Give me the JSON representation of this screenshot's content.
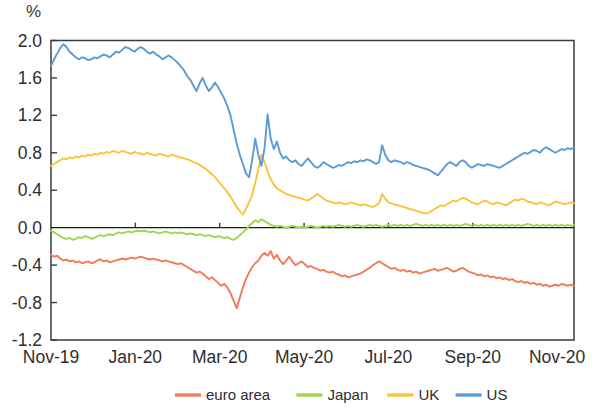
{
  "chart_data": {
    "type": "line",
    "title": "",
    "subtitle": "",
    "unit_label": "%",
    "xlabel": "",
    "ylabel": "",
    "ylim": [
      -1.2,
      2.0
    ],
    "ytick_values": [
      2.0,
      1.6,
      1.2,
      0.8,
      0.4,
      0.0,
      -0.4,
      -0.8,
      -1.2
    ],
    "ytick_labels": [
      "2.0",
      "1.6",
      "1.2",
      "0.8",
      "0.4",
      "0.0",
      "-0.4",
      "-0.8",
      "-1.2"
    ],
    "xtick_labels": [
      "Nov-19",
      "Jan-20",
      "Mar-20",
      "May-20",
      "Jul-20",
      "Sep-20",
      "Nov-20"
    ],
    "xtick_positions": [
      0,
      2,
      4,
      6,
      8,
      10,
      12
    ],
    "xlim": [
      0,
      12.4
    ],
    "grid": false,
    "legend_position": "bottom",
    "colors": {
      "euro area": "#f07a5a",
      "Japan": "#a3d44e",
      "UK": "#f5c53d",
      "US": "#5b9bd5",
      "axis": "#3b3b3b",
      "zero_line": "#1a1a1a",
      "background": "#ffffff"
    },
    "series": [
      {
        "name": "euro area",
        "color": "#f07a5a",
        "values": [
          -0.29,
          -0.31,
          -0.3,
          -0.33,
          -0.35,
          -0.34,
          -0.36,
          -0.35,
          -0.37,
          -0.36,
          -0.38,
          -0.37,
          -0.36,
          -0.38,
          -0.37,
          -0.35,
          -0.34,
          -0.36,
          -0.35,
          -0.37,
          -0.36,
          -0.35,
          -0.34,
          -0.33,
          -0.34,
          -0.33,
          -0.32,
          -0.33,
          -0.32,
          -0.31,
          -0.32,
          -0.33,
          -0.34,
          -0.33,
          -0.34,
          -0.35,
          -0.36,
          -0.35,
          -0.36,
          -0.37,
          -0.38,
          -0.39,
          -0.38,
          -0.4,
          -0.42,
          -0.44,
          -0.46,
          -0.48,
          -0.47,
          -0.49,
          -0.52,
          -0.55,
          -0.53,
          -0.56,
          -0.59,
          -0.62,
          -0.6,
          -0.64,
          -0.7,
          -0.78,
          -0.86,
          -0.75,
          -0.64,
          -0.55,
          -0.48,
          -0.42,
          -0.38,
          -0.35,
          -0.3,
          -0.27,
          -0.3,
          -0.25,
          -0.33,
          -0.29,
          -0.35,
          -0.39,
          -0.35,
          -0.31,
          -0.36,
          -0.4,
          -0.38,
          -0.36,
          -0.39,
          -0.42,
          -0.41,
          -0.43,
          -0.44,
          -0.46,
          -0.45,
          -0.47,
          -0.48,
          -0.47,
          -0.49,
          -0.5,
          -0.52,
          -0.51,
          -0.53,
          -0.52,
          -0.51,
          -0.5,
          -0.49,
          -0.47,
          -0.45,
          -0.43,
          -0.4,
          -0.38,
          -0.36,
          -0.38,
          -0.4,
          -0.42,
          -0.44,
          -0.43,
          -0.45,
          -0.46,
          -0.45,
          -0.47,
          -0.46,
          -0.48,
          -0.47,
          -0.49,
          -0.48,
          -0.47,
          -0.46,
          -0.45,
          -0.44,
          -0.46,
          -0.45,
          -0.44,
          -0.43,
          -0.45,
          -0.47,
          -0.46,
          -0.44,
          -0.43,
          -0.45,
          -0.47,
          -0.48,
          -0.49,
          -0.51,
          -0.5,
          -0.52,
          -0.51,
          -0.53,
          -0.52,
          -0.54,
          -0.53,
          -0.55,
          -0.54,
          -0.56,
          -0.55,
          -0.57,
          -0.58,
          -0.57,
          -0.59,
          -0.58,
          -0.6,
          -0.59,
          -0.61,
          -0.6,
          -0.62,
          -0.61,
          -0.63,
          -0.62,
          -0.61,
          -0.62,
          -0.6,
          -0.61,
          -0.62,
          -0.61,
          -0.62
        ]
      },
      {
        "name": "Japan",
        "color": "#a3d44e",
        "values": [
          -0.03,
          -0.05,
          -0.07,
          -0.09,
          -0.11,
          -0.12,
          -0.11,
          -0.13,
          -0.12,
          -0.1,
          -0.11,
          -0.09,
          -0.1,
          -0.12,
          -0.11,
          -0.09,
          -0.08,
          -0.09,
          -0.08,
          -0.07,
          -0.08,
          -0.06,
          -0.05,
          -0.06,
          -0.05,
          -0.04,
          -0.05,
          -0.04,
          -0.03,
          -0.04,
          -0.03,
          -0.04,
          -0.05,
          -0.04,
          -0.05,
          -0.06,
          -0.05,
          -0.04,
          -0.05,
          -0.06,
          -0.05,
          -0.06,
          -0.05,
          -0.06,
          -0.07,
          -0.06,
          -0.07,
          -0.08,
          -0.07,
          -0.08,
          -0.09,
          -0.08,
          -0.09,
          -0.1,
          -0.09,
          -0.1,
          -0.11,
          -0.1,
          -0.12,
          -0.13,
          -0.11,
          -0.08,
          -0.05,
          -0.02,
          0.02,
          0.05,
          0.08,
          0.06,
          0.09,
          0.07,
          0.05,
          0.03,
          0.02,
          0.01,
          0.02,
          0.01,
          0.0,
          0.01,
          0.02,
          0.01,
          0.0,
          0.01,
          0.0,
          0.01,
          0.02,
          0.01,
          0.0,
          0.01,
          0.02,
          0.01,
          0.02,
          0.01,
          0.02,
          0.03,
          0.02,
          0.01,
          0.02,
          0.01,
          0.02,
          0.03,
          0.02,
          0.01,
          0.02,
          0.03,
          0.02,
          0.03,
          0.02,
          0.01,
          0.02,
          0.03,
          0.02,
          0.03,
          0.02,
          0.03,
          0.02,
          0.03,
          0.02,
          0.03,
          0.04,
          0.03,
          0.02,
          0.03,
          0.02,
          0.03,
          0.02,
          0.03,
          0.02,
          0.03,
          0.02,
          0.03,
          0.02,
          0.03,
          0.02,
          0.03,
          0.04,
          0.03,
          0.02,
          0.03,
          0.02,
          0.03,
          0.02,
          0.03,
          0.02,
          0.03,
          0.02,
          0.03,
          0.02,
          0.03,
          0.02,
          0.03,
          0.02,
          0.03,
          0.02,
          0.03,
          0.04,
          0.03,
          0.02,
          0.03,
          0.02,
          0.03,
          0.02,
          0.03,
          0.02,
          0.03,
          0.02,
          0.03,
          0.02,
          0.03,
          0.02,
          0.03
        ]
      },
      {
        "name": "UK",
        "color": "#f5c53d",
        "values": [
          0.66,
          0.68,
          0.7,
          0.72,
          0.74,
          0.73,
          0.75,
          0.74,
          0.76,
          0.75,
          0.77,
          0.76,
          0.78,
          0.77,
          0.79,
          0.78,
          0.8,
          0.79,
          0.81,
          0.8,
          0.82,
          0.81,
          0.8,
          0.82,
          0.81,
          0.8,
          0.79,
          0.81,
          0.8,
          0.79,
          0.78,
          0.8,
          0.79,
          0.78,
          0.77,
          0.79,
          0.78,
          0.77,
          0.76,
          0.78,
          0.77,
          0.76,
          0.75,
          0.74,
          0.73,
          0.72,
          0.7,
          0.69,
          0.67,
          0.65,
          0.63,
          0.6,
          0.57,
          0.54,
          0.5,
          0.46,
          0.42,
          0.38,
          0.33,
          0.28,
          0.22,
          0.18,
          0.14,
          0.2,
          0.27,
          0.35,
          0.48,
          0.62,
          0.78,
          0.7,
          0.6,
          0.52,
          0.46,
          0.42,
          0.4,
          0.38,
          0.36,
          0.35,
          0.34,
          0.33,
          0.32,
          0.31,
          0.3,
          0.29,
          0.31,
          0.33,
          0.36,
          0.34,
          0.31,
          0.29,
          0.28,
          0.27,
          0.26,
          0.27,
          0.26,
          0.25,
          0.26,
          0.27,
          0.26,
          0.25,
          0.24,
          0.25,
          0.24,
          0.23,
          0.22,
          0.24,
          0.26,
          0.36,
          0.31,
          0.27,
          0.26,
          0.25,
          0.24,
          0.23,
          0.22,
          0.21,
          0.2,
          0.19,
          0.18,
          0.17,
          0.16,
          0.15,
          0.16,
          0.18,
          0.2,
          0.22,
          0.24,
          0.23,
          0.25,
          0.27,
          0.29,
          0.28,
          0.3,
          0.32,
          0.31,
          0.29,
          0.27,
          0.26,
          0.25,
          0.27,
          0.29,
          0.28,
          0.26,
          0.25,
          0.27,
          0.26,
          0.25,
          0.24,
          0.26,
          0.28,
          0.3,
          0.29,
          0.31,
          0.3,
          0.28,
          0.27,
          0.26,
          0.25,
          0.27,
          0.26,
          0.25,
          0.24,
          0.26,
          0.28,
          0.27,
          0.26,
          0.25,
          0.26,
          0.27,
          0.26
        ]
      },
      {
        "name": "US",
        "color": "#5b9bd5",
        "values": [
          1.73,
          1.8,
          1.86,
          1.92,
          1.96,
          1.93,
          1.88,
          1.85,
          1.82,
          1.8,
          1.82,
          1.81,
          1.79,
          1.8,
          1.82,
          1.81,
          1.83,
          1.85,
          1.84,
          1.82,
          1.85,
          1.88,
          1.87,
          1.9,
          1.93,
          1.92,
          1.9,
          1.88,
          1.91,
          1.93,
          1.91,
          1.88,
          1.86,
          1.88,
          1.85,
          1.83,
          1.8,
          1.82,
          1.84,
          1.82,
          1.79,
          1.76,
          1.72,
          1.68,
          1.62,
          1.58,
          1.52,
          1.46,
          1.54,
          1.6,
          1.52,
          1.46,
          1.5,
          1.55,
          1.5,
          1.44,
          1.38,
          1.3,
          1.2,
          1.05,
          0.9,
          0.78,
          0.68,
          0.58,
          0.54,
          0.72,
          0.95,
          0.78,
          0.66,
          0.85,
          1.21,
          0.95,
          0.84,
          0.92,
          0.8,
          0.74,
          0.76,
          0.72,
          0.7,
          0.72,
          0.68,
          0.66,
          0.7,
          0.74,
          0.7,
          0.66,
          0.64,
          0.66,
          0.7,
          0.68,
          0.66,
          0.64,
          0.65,
          0.67,
          0.66,
          0.68,
          0.7,
          0.69,
          0.71,
          0.7,
          0.72,
          0.71,
          0.73,
          0.72,
          0.7,
          0.68,
          0.7,
          0.88,
          0.78,
          0.72,
          0.7,
          0.72,
          0.71,
          0.7,
          0.68,
          0.7,
          0.69,
          0.67,
          0.66,
          0.65,
          0.64,
          0.63,
          0.62,
          0.6,
          0.58,
          0.56,
          0.6,
          0.64,
          0.68,
          0.7,
          0.68,
          0.66,
          0.7,
          0.72,
          0.7,
          0.66,
          0.64,
          0.66,
          0.68,
          0.67,
          0.66,
          0.68,
          0.67,
          0.66,
          0.65,
          0.64,
          0.66,
          0.68,
          0.7,
          0.72,
          0.74,
          0.76,
          0.78,
          0.8,
          0.79,
          0.81,
          0.83,
          0.82,
          0.8,
          0.84,
          0.86,
          0.84,
          0.82,
          0.8,
          0.82,
          0.84,
          0.83,
          0.85,
          0.84,
          0.86
        ]
      }
    ],
    "legend": [
      {
        "label": "euro area",
        "color": "#f07a5a"
      },
      {
        "label": "Japan",
        "color": "#a3d44e"
      },
      {
        "label": "UK",
        "color": "#f5c53d"
      },
      {
        "label": "US",
        "color": "#5b9bd5"
      }
    ]
  }
}
